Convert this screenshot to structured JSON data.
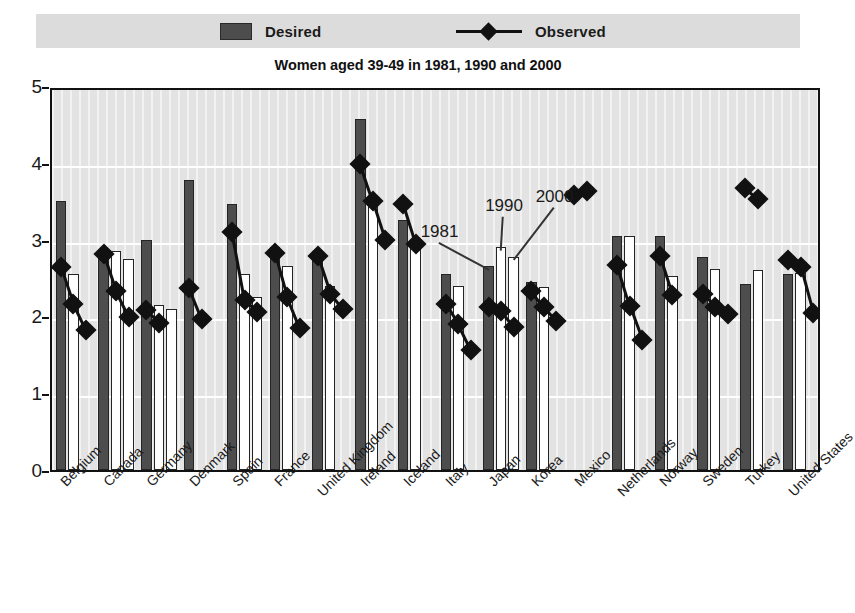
{
  "legend": {
    "desired_label": "Desired",
    "observed_label": "Observed",
    "desired_color": "#4d4d4d",
    "observed_color": "#111111",
    "band_color": "#dcdcdc"
  },
  "title": "Women aged 39-49 in 1981, 1990 and 2000",
  "annotations": [
    {
      "text": "1981"
    },
    {
      "text": "1990"
    },
    {
      "text": "2000"
    }
  ],
  "chart_data": {
    "type": "bar",
    "title": "Women aged 39-49 in 1981, 1990 and 2000",
    "xlabel": "",
    "ylabel": "",
    "ylim": [
      0,
      5
    ],
    "yticks": [
      0,
      1,
      2,
      3,
      4,
      5
    ],
    "ytick_labels": [
      "0",
      "1",
      "2",
      "3",
      "4",
      "5"
    ],
    "grid": "horizontal",
    "legend_position": "top",
    "years": [
      "1981",
      "1990",
      "2000"
    ],
    "categories": [
      "Belgium",
      "Canada",
      "Germany",
      "Denmark",
      "Spain",
      "France",
      "United Kingdom",
      "Ireland",
      "Iceland",
      "Italy",
      "Japan",
      "Korea",
      "Mexico",
      "Netherlands",
      "Norway",
      "Sweden",
      "Turkey",
      "United States"
    ],
    "series": [
      {
        "name": "Desired",
        "type": "bar",
        "note": "Three bars per country (1981, 1990, 2000); null = no bar drawn",
        "values": [
          [
            3.5,
            2.55,
            null
          ],
          [
            2.8,
            2.85,
            2.75
          ],
          [
            3.0,
            2.15,
            2.1
          ],
          [
            3.78,
            null,
            null
          ],
          [
            3.47,
            2.55,
            2.25
          ],
          [
            2.9,
            2.65,
            null
          ],
          [
            2.85,
            2.4,
            null
          ],
          [
            4.57,
            3.45,
            null
          ],
          [
            3.25,
            2.98,
            null
          ],
          [
            2.55,
            2.4,
            null
          ],
          [
            2.65,
            2.9,
            2.78
          ],
          [
            2.45,
            2.38,
            null
          ],
          [
            null,
            null,
            null
          ],
          [
            3.05,
            3.05,
            null
          ],
          [
            3.05,
            2.52,
            null
          ],
          [
            2.78,
            2.62,
            null
          ],
          [
            2.42,
            2.6,
            null
          ],
          [
            2.55,
            2.57,
            null
          ]
        ]
      },
      {
        "name": "Observed",
        "type": "line-marker",
        "note": "Diamond markers joined by segments; one per year shown",
        "values": [
          [
            2.7,
            2.22,
            1.88
          ],
          [
            2.86,
            2.38,
            2.05
          ],
          [
            2.14,
            1.97,
            null
          ],
          [
            2.42,
            2.02,
            null
          ],
          [
            3.15,
            2.26,
            2.11
          ],
          [
            2.88,
            2.3,
            1.9
          ],
          [
            2.84,
            2.35,
            2.15
          ],
          [
            4.03,
            3.55,
            3.05
          ],
          [
            3.52,
            3.0,
            null
          ],
          [
            2.22,
            1.95,
            1.62
          ],
          [
            2.18,
            2.12,
            1.92
          ],
          [
            2.38,
            2.17,
            1.99
          ],
          [
            3.63,
            3.68,
            null
          ],
          [
            2.72,
            2.19,
            1.75
          ],
          [
            2.84,
            2.33,
            null
          ],
          [
            2.35,
            2.18,
            2.08
          ],
          [
            3.72,
            3.58,
            null
          ],
          [
            2.78,
            2.7,
            2.1
          ]
        ]
      }
    ]
  }
}
